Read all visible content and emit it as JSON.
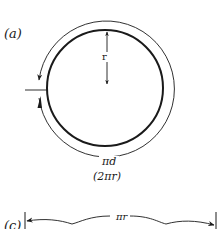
{
  "figure": {
    "panel_a": {
      "label": "(a)",
      "radius_label": "r",
      "circumference_label": "πd",
      "circumference_alt_label": "(2πr)"
    },
    "panel_c": {
      "label": "(c)",
      "arc_length_label": "πr"
    }
  },
  "colors": {
    "stroke": "#1a1a1a",
    "background": "#ffffff"
  }
}
